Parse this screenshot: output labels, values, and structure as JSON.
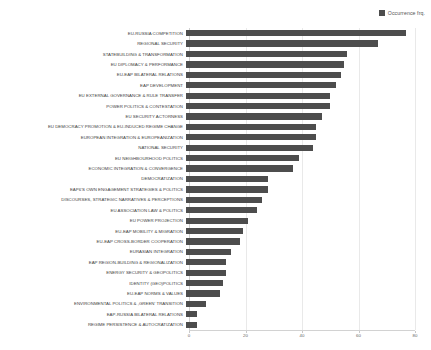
{
  "legend": {
    "label": "Occurrence frq.",
    "swatch_color": "#4d4d4d",
    "position": "top-right"
  },
  "axis": {
    "x_ticks": [
      "0",
      "20",
      "40",
      "60",
      "80"
    ],
    "y_label": "",
    "x_label": ""
  },
  "chart_data": {
    "type": "bar",
    "orientation": "horizontal",
    "title": "",
    "subtitle": "",
    "xlabel": "",
    "ylabel": "",
    "xlim": [
      0,
      80
    ],
    "grid": true,
    "legend_position": "top-right",
    "series_name": "Occurrence frq.",
    "bar_color": "#4d4d4d",
    "categories": [
      "EU-RUSSIA COMPETITION",
      "REGIONAL SECURITY",
      "STATEBUILDING & TRANSFORMATION",
      "EU DIPLOMACY & PERFORMANCE",
      "EU-EAP BILATERAL RELATIONS",
      "EAP DEVELOPMENT",
      "EU EXTERNAL GOVERNANCE & RULE TRANSFER",
      "POWER POLITICS & CONTESTATION",
      "EU SECURITY ACTORNESS",
      "EU DEMOCRACY PROMOTION & EU-INDUCED REGIME CHANGE",
      "EUROPEAN INTEGRATION & EUROPEANIZATION",
      "NATIONAL SECURITY",
      "EU NEIGHBOURHOOD POLITICS",
      "ECONOMIC INTEGRATION & CONVERGENCE",
      "DEMOCRATIZATION",
      "EAP6'S OWN ENGAGEMENT STRATEGIES & POLITICS",
      "DISCOURSES, STRATEGIC NARRATIVES & PERCEPTIONS",
      "EU ASSOCIATION LAW & POLITICS",
      "EU POWER PROJECTION",
      "EU-EAP MOBILITY & MIGRATION",
      "EU-EAP CROSS-BORDER COOPERATION",
      "EURASIAN INTEGRATION",
      "EAP REGION-BUILDING & REGIONALIZATION",
      "ENERGY SECURITY & GEOPOLITICS",
      "IDENTITY (GEO)POLITICS",
      "EU-EAP NORMS & VALUES",
      "ENVIRONMENTAL POLITICS & ,GREEN' TRANSITION",
      "EAP-RUSSIA BILATERAL RELATIONS",
      "REGIME PERSISTENCE & AUTOCRATIZATION"
    ],
    "values": [
      78,
      68,
      57,
      56,
      55,
      53,
      51,
      51,
      48,
      46,
      46,
      45,
      40,
      38,
      29,
      29,
      27,
      25,
      22,
      20,
      19,
      16,
      14,
      14,
      13,
      12,
      7,
      4,
      4
    ]
  }
}
